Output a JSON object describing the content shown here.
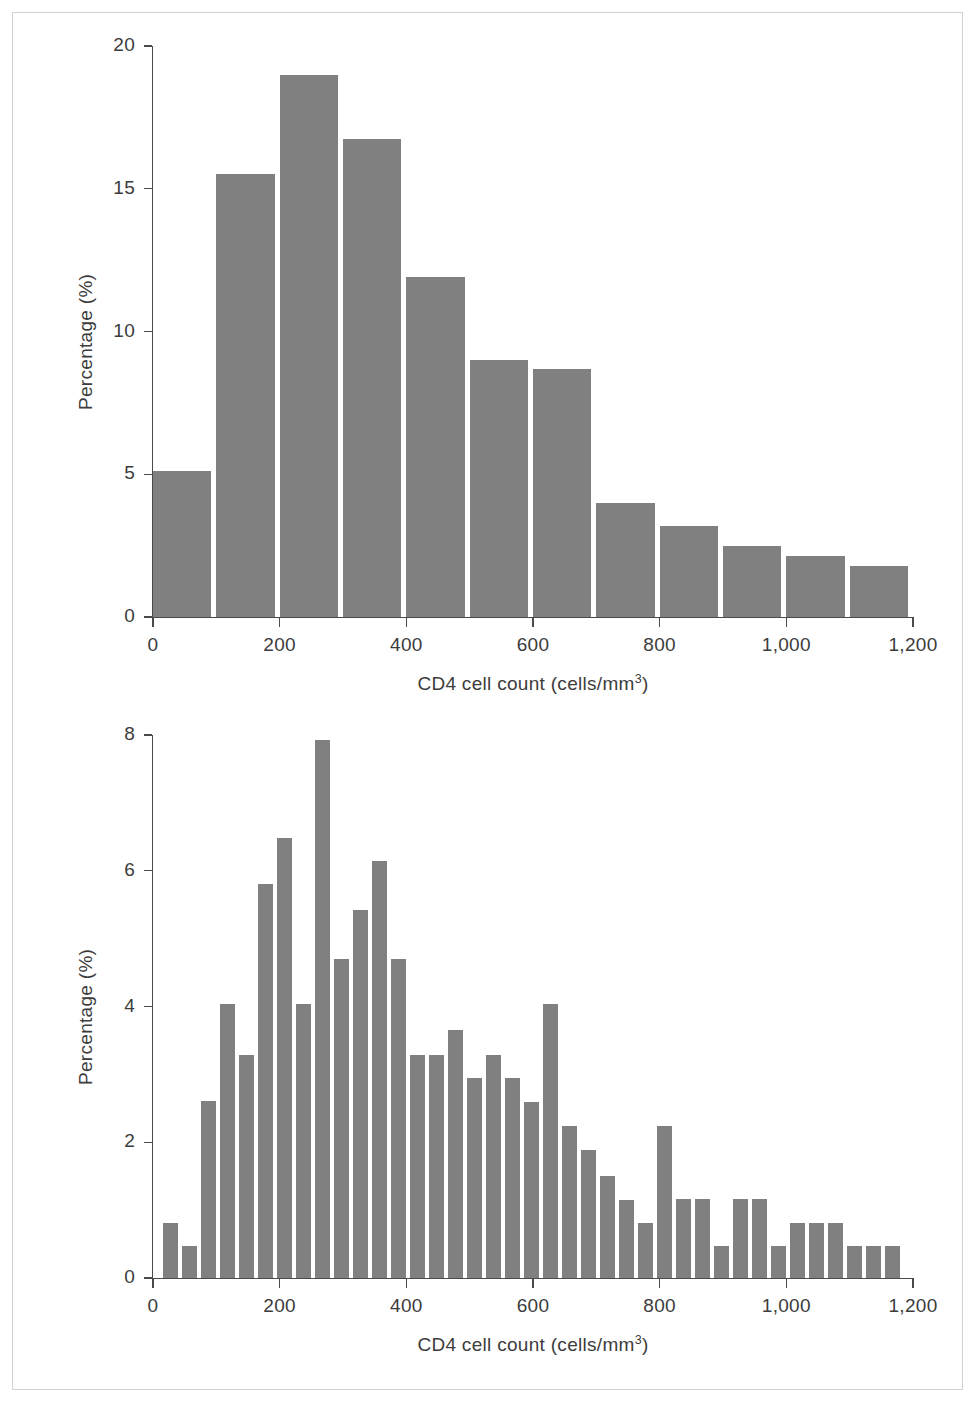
{
  "figure": {
    "background": "#ffffff",
    "frame_color": "#d2d2d2",
    "bar_color": "#808080",
    "axis_color": "#4a4a4a"
  },
  "panels": {
    "top": {
      "xlabel_main": "CD4 cell count (cells/mm",
      "xlabel_sup": "3",
      "xlabel_close": ")",
      "ylabel_text": "Percentage (%)",
      "xticks": [
        "0",
        "200",
        "400",
        "600",
        "800",
        "1,000",
        "1,200"
      ],
      "yticks": [
        "0",
        "5",
        "10",
        "15",
        "20"
      ]
    },
    "bottom": {
      "xlabel_main": "CD4 cell count (cells/mm",
      "xlabel_sup": "3",
      "xlabel_close": ")",
      "ylabel_text": "Percentage (%)",
      "xticks": [
        "0",
        "200",
        "400",
        "600",
        "800",
        "1,000",
        "1,200"
      ],
      "yticks": [
        "0",
        "2",
        "4",
        "6",
        "8"
      ]
    }
  },
  "chart_data": [
    {
      "id": "top",
      "type": "bar",
      "title": "",
      "xlabel": "CD4 cell count (cells/mm3)",
      "ylabel": "Percentage (%)",
      "xlim": [
        0,
        1200
      ],
      "ylim": [
        0,
        20
      ],
      "xtick_values": [
        0,
        200,
        400,
        600,
        800,
        1000,
        1200
      ],
      "ytick_values": [
        0,
        5,
        10,
        15,
        20
      ],
      "grid": false,
      "legend": "none",
      "bin_width": 100,
      "bin_starts": [
        0,
        100,
        200,
        300,
        400,
        500,
        600,
        700,
        800,
        900,
        1000,
        1100
      ],
      "categories": [
        "0-100",
        "100-200",
        "200-300",
        "300-400",
        "400-500",
        "500-600",
        "600-700",
        "700-800",
        "800-900",
        "900-1000",
        "1000-1100",
        "1100-1200"
      ],
      "values": [
        5.1,
        15.5,
        19.0,
        16.75,
        11.9,
        9.0,
        8.7,
        4.0,
        3.2,
        2.5,
        2.15,
        1.8
      ]
    },
    {
      "id": "bottom",
      "type": "bar",
      "title": "",
      "xlabel": "CD4 cell count (cells/mm3)",
      "ylabel": "Percentage (%)",
      "xlim": [
        0,
        1200
      ],
      "ylim": [
        0,
        8
      ],
      "xtick_values": [
        0,
        200,
        400,
        600,
        800,
        1000,
        1200
      ],
      "ytick_values": [
        0,
        2,
        4,
        6,
        8
      ],
      "grid": false,
      "legend": "none",
      "bin_width": 30,
      "bin_starts": [
        15,
        45,
        75,
        105,
        135,
        165,
        195,
        225,
        255,
        285,
        315,
        345,
        375,
        405,
        435,
        465,
        495,
        525,
        555,
        585,
        615,
        645,
        675,
        705,
        735,
        765,
        795,
        825,
        855,
        885,
        915,
        945,
        975,
        1005,
        1035,
        1065,
        1095,
        1125,
        1155
      ],
      "categories": [
        "15-45",
        "45-75",
        "75-105",
        "105-135",
        "135-165",
        "165-195",
        "195-225",
        "225-255",
        "255-285",
        "285-315",
        "315-345",
        "345-375",
        "375-405",
        "405-435",
        "435-465",
        "465-495",
        "495-525",
        "525-555",
        "555-585",
        "585-615",
        "615-645",
        "645-675",
        "675-705",
        "705-735",
        "735-765",
        "765-795",
        "795-825",
        "825-855",
        "855-885",
        "885-915",
        "915-945",
        "945-975",
        "975-1005",
        "1005-1035",
        "1035-1065",
        "1065-1095",
        "1095-1125",
        "1125-1155",
        "1155-1185"
      ],
      "values": [
        0.81,
        0.47,
        2.61,
        4.04,
        3.28,
        5.8,
        6.48,
        4.04,
        7.92,
        4.7,
        5.42,
        6.15,
        4.7,
        3.28,
        3.28,
        3.65,
        2.94,
        3.28,
        2.94,
        2.59,
        4.03,
        2.24,
        1.88,
        1.5,
        1.15,
        0.81,
        2.24,
        1.16,
        1.16,
        0.47,
        1.16,
        1.16,
        0.47,
        0.81,
        0.81,
        0.81,
        0.47,
        0.47,
        0.47
      ]
    }
  ]
}
